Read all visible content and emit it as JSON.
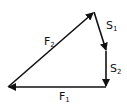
{
  "diagram": {
    "type": "vector-triangle",
    "line_color": "#111111",
    "vectors": [
      {
        "name": "F1",
        "label_main": "F",
        "label_sub": "1",
        "from": [
          106,
          87
        ],
        "to": [
          8,
          87
        ]
      },
      {
        "name": "F2",
        "label_main": "F",
        "label_sub": "2",
        "from": [
          8,
          87
        ],
        "to": [
          94,
          12
        ]
      },
      {
        "name": "S1",
        "label_main": "S",
        "label_sub": "1",
        "from": [
          94,
          12
        ],
        "to": [
          106,
          51
        ]
      },
      {
        "name": "S2",
        "label_main": "S",
        "label_sub": "2",
        "from": [
          106,
          51
        ],
        "to": [
          106,
          87
        ]
      }
    ]
  }
}
